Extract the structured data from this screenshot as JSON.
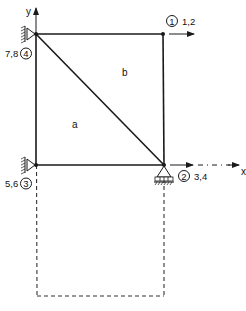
{
  "diagram": {
    "type": "finite-element-mesh",
    "axes": {
      "x_label": "x",
      "y_label": "y"
    },
    "elements": [
      {
        "id": "a",
        "label": "a"
      },
      {
        "id": "b",
        "label": "b"
      }
    ],
    "nodes": [
      {
        "id": 1,
        "number": "1",
        "dofs": "1,2",
        "support": "none"
      },
      {
        "id": 2,
        "number": "2",
        "dofs": "3,4",
        "support": "roller"
      },
      {
        "id": 3,
        "number": "3",
        "dofs": "5,6",
        "support": "pin-wall"
      },
      {
        "id": 4,
        "number": "4",
        "dofs": "7,8",
        "support": "pin-wall"
      }
    ],
    "deformed_shape": "dashed"
  }
}
